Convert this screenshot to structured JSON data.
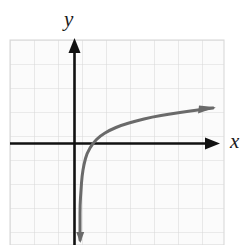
{
  "figure": {
    "background_color": "#ffffff",
    "width": 251,
    "height": 245
  },
  "axes": {
    "x_label": "x",
    "y_label": "y",
    "axis_color": "#111111",
    "origin_px": {
      "x": 74,
      "y": 143
    },
    "cell_size_px": 24,
    "x_axis": {
      "start_px": 10,
      "end_px": 218,
      "y_px": 143,
      "arrow": "right"
    },
    "y_axis": {
      "top_px": 40,
      "bottom_px": 245,
      "x_px": 74,
      "arrow": "up"
    }
  },
  "grid": {
    "color": "#d8d8d8",
    "background": "#fbfbfb",
    "left_px": 10,
    "top_px": 40,
    "right_px": 224,
    "bottom_px": 245,
    "columns": 9,
    "rows": 9,
    "visible": true
  },
  "chart_data": {
    "type": "line",
    "title": "",
    "xlabel": "x",
    "ylabel": "y",
    "grid": true,
    "legend": null,
    "xlim": [
      -2.67,
      6.25
    ],
    "ylim": [
      -4.29,
      4.29
    ],
    "axis_tick_spacing": 1,
    "series": [
      {
        "name": "logarithmic-curve",
        "color": "#6a6a6a",
        "linewidth_px": 3,
        "vertical_asymptote_x": 0.17,
        "x_intercept": 0.79,
        "arrow_start": "down",
        "arrow_end": "up-right",
        "points_px": [
          {
            "x": 80,
            "y": 240
          },
          {
            "x": 80,
            "y": 222
          },
          {
            "x": 80,
            "y": 205
          },
          {
            "x": 81,
            "y": 190
          },
          {
            "x": 82,
            "y": 176
          },
          {
            "x": 84,
            "y": 164
          },
          {
            "x": 87,
            "y": 153
          },
          {
            "x": 93,
            "y": 143
          },
          {
            "x": 100,
            "y": 136
          },
          {
            "x": 110,
            "y": 130
          },
          {
            "x": 122,
            "y": 125
          },
          {
            "x": 136,
            "y": 121
          },
          {
            "x": 152,
            "y": 117
          },
          {
            "x": 170,
            "y": 114
          },
          {
            "x": 190,
            "y": 111
          },
          {
            "x": 213,
            "y": 108
          }
        ],
        "data_points": [
          {
            "x": 0.25,
            "y": -4.04
          },
          {
            "x": 0.25,
            "y": -3.29
          },
          {
            "x": 0.25,
            "y": -2.58
          },
          {
            "x": 0.29,
            "y": -1.96
          },
          {
            "x": 0.33,
            "y": -1.38
          },
          {
            "x": 0.42,
            "y": -0.88
          },
          {
            "x": 0.54,
            "y": -0.42
          },
          {
            "x": 0.79,
            "y": 0.0
          },
          {
            "x": 1.08,
            "y": 0.29
          },
          {
            "x": 1.5,
            "y": 0.54
          },
          {
            "x": 2.0,
            "y": 0.75
          },
          {
            "x": 2.58,
            "y": 0.92
          },
          {
            "x": 3.25,
            "y": 1.08
          },
          {
            "x": 4.0,
            "y": 1.21
          },
          {
            "x": 4.83,
            "y": 1.33
          },
          {
            "x": 5.79,
            "y": 1.46
          }
        ]
      }
    ]
  }
}
